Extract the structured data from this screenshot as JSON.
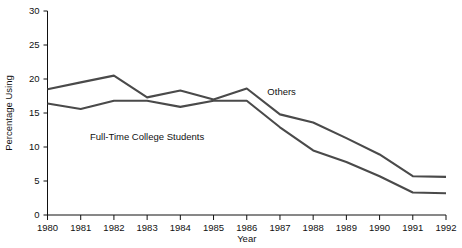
{
  "chart_data": {
    "type": "line",
    "title": "",
    "xlabel": "Year",
    "ylabel": "Percentage Using",
    "x": [
      1980,
      1981,
      1982,
      1983,
      1984,
      1985,
      1986,
      1987,
      1988,
      1989,
      1990,
      1991,
      1992
    ],
    "xticklabels": [
      "1980",
      "1981",
      "1982",
      "1983",
      "1984",
      "1985",
      "1986",
      "1987",
      "1988",
      "1989",
      "1990",
      "1991",
      "1992"
    ],
    "yticklabels": [
      "0",
      "5",
      "10",
      "15",
      "20",
      "25",
      "30"
    ],
    "yticks": [
      0,
      5,
      10,
      15,
      20,
      25,
      30
    ],
    "xlim": [
      1980,
      1992
    ],
    "ylim": [
      0,
      30
    ],
    "grid": false,
    "legend": "inline-annotations",
    "line_color": "#4a4a4a",
    "axis_color": "#111111",
    "background": "#ffffff",
    "series": [
      {
        "name": "Others",
        "label": "Others",
        "color": "#4a4a4a",
        "label_x": 1987.05,
        "label_y": 17.6,
        "values": [
          18.5,
          19.5,
          20.5,
          17.3,
          18.3,
          17.0,
          18.6,
          14.8,
          13.6,
          11.3,
          8.9,
          5.7,
          5.6
        ]
      },
      {
        "name": "Full-Time College Students",
        "label": "Full-Time College Students",
        "color": "#4a4a4a",
        "label_x": 1983.0,
        "label_y": 11.1,
        "values": [
          16.4,
          15.6,
          16.8,
          16.8,
          15.9,
          16.8,
          16.8,
          12.9,
          9.5,
          7.8,
          5.7,
          3.3,
          3.2
        ]
      }
    ]
  },
  "axes": {
    "y_title": "Percentage Using",
    "x_title": "Year"
  }
}
